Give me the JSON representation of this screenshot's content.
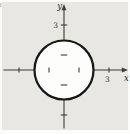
{
  "figure": {
    "background_color": "#e9e7e2",
    "page_margin_color": "#fcfcfa",
    "circle": {
      "center_units": [
        0,
        0
      ],
      "radius_units": 2,
      "fill": "#fdfdfc",
      "stroke": "#161616"
    },
    "axes": {
      "color": "#3d3c3a",
      "x_label": "x",
      "y_label": "y",
      "x_ticks_units": [
        -3,
        -1,
        1,
        3
      ],
      "y_ticks_units": [
        -3,
        -1,
        1,
        3
      ],
      "x_tick_label": "3",
      "y_tick_label": "3",
      "x_tick_label_position_units": 3,
      "y_tick_label_position_units": 3
    }
  }
}
